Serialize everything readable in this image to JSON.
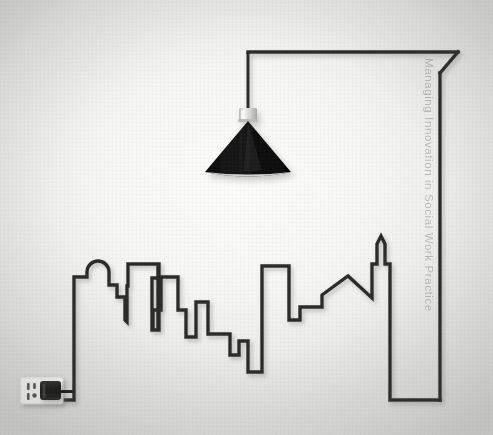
{
  "artwork": {
    "title_vertical": "Managing Innovation in Social Work Practice",
    "scene_description": "Minimal line illustration: a single black power cord traces a city skyline, rises to the upper right corner and hangs a cone pendant lamp, ending plugged into a wall outlet at lower left.",
    "background_color": "#f5f5f3",
    "line_color": "#2b2b2b",
    "lamp_shade_color": "#121212",
    "lamp_socket_color": "#d8d8d6",
    "outlet_plate_color": "#fbfbfa",
    "plug_color": "#1c1c1c",
    "text_color": "#8d8d8a"
  },
  "elements": {
    "cord_label": "power-cord",
    "skyline_label": "city-skyline",
    "lamp_label": "pendant-lamp",
    "outlet_label": "wall-outlet",
    "plug_label": "electric-plug",
    "spine_label": "vertical-title"
  },
  "geometry": {
    "canvas_width": 493,
    "canvas_height": 435,
    "lamp_center_x": 248,
    "lamp_cone_top_y": 118,
    "lamp_cone_bottom_y": 176,
    "lamp_cone_half_width": 43,
    "cord_top_right_x": 458,
    "cord_top_y": 52,
    "cord_bottom_y": 400,
    "outlet_x": 20,
    "outlet_y": 377
  }
}
